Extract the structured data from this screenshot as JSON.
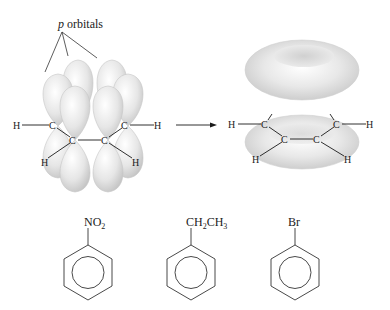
{
  "title_label": {
    "italic": "p",
    "rest": " orbitals"
  },
  "left_molecule": {
    "atoms": [
      "H",
      "C",
      "C",
      "C",
      "C",
      "H",
      "H",
      "H"
    ]
  },
  "right_molecule": {
    "atoms": [
      "H",
      "C",
      "C",
      "C",
      "C",
      "H",
      "H",
      "H"
    ]
  },
  "arrow": "reaction-arrow",
  "benzenes": [
    {
      "substituent_main": "NO",
      "substituent_sub": "2",
      "substituent_tail": ""
    },
    {
      "substituent_main": "CH",
      "substituent_sub": "2",
      "substituent_tail": "CH",
      "substituent_sub2": "3"
    },
    {
      "substituent_main": "Br"
    }
  ],
  "colors": {
    "orbital_fill": "#e2e2e2",
    "orbital_edge": "#c8c8c8",
    "line": "#1a1a1a"
  }
}
